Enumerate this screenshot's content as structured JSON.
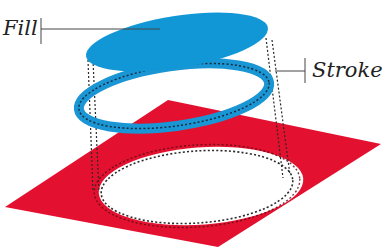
{
  "labels": {
    "fill": "Fill",
    "stroke": "Stroke"
  },
  "colors": {
    "fill_blue": "#1297d6",
    "stroke_blue": "#1a96d4",
    "plane_red": "#e3112f",
    "dotted_line": "#2a2a2a",
    "leader_line": "#444444",
    "background": "#ffffff"
  },
  "parts": [
    {
      "name": "fill",
      "shape": "solid ellipse"
    },
    {
      "name": "stroke",
      "shape": "ring outline with dashed centerline"
    },
    {
      "name": "shape-on-plane",
      "shape": "elliptical hole cut in red plane"
    }
  ]
}
